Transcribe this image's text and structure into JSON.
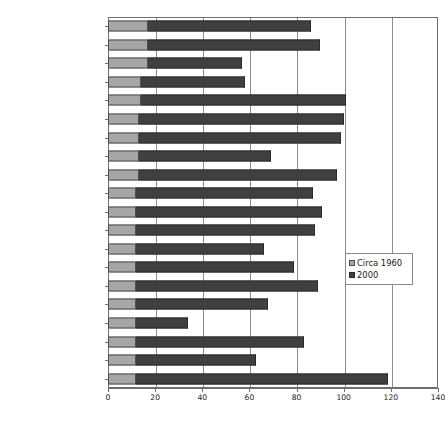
{
  "chart_data": {
    "type": "bar",
    "orientation": "horizontal",
    "stacked": true,
    "title": "",
    "xlabel": "",
    "ylabel": "",
    "xlim": [
      0,
      140
    ],
    "xticks": [
      0,
      20,
      40,
      60,
      80,
      100,
      120,
      140
    ],
    "grid": true,
    "legend_position": "center-right",
    "categories": [
      "Malaysia",
      "Lebanon",
      "Iraq",
      "Syrian Arab Republic",
      "Egypt",
      "South Africa",
      "Peru",
      "Turkey",
      "Cuba",
      "Tunisia",
      "Thailand",
      "Iran, Islamic Republic of",
      "Ecuador",
      "Colombia",
      "Bolivia",
      "Paraguay",
      "Pakistan",
      "Mexico",
      "El Salvador",
      "Brazil"
    ],
    "series": [
      {
        "name": "Circa 1960",
        "color": "#a6a6a6",
        "values": [
          17,
          17,
          17,
          14,
          14,
          13,
          13,
          13,
          13,
          12,
          12,
          12,
          12,
          12,
          12,
          12,
          12,
          12,
          12,
          12
        ]
      },
      {
        "name": "2000",
        "color": "#404040",
        "values": [
          69,
          73,
          40,
          44,
          87,
          87,
          86,
          56,
          84,
          75,
          79,
          76,
          54,
          67,
          77,
          56,
          22,
          71,
          51,
          107
        ]
      }
    ],
    "totals": [
      86,
      90,
      57,
      58,
      101,
      100,
      99,
      69,
      97,
      87,
      91,
      88,
      66,
      79,
      89,
      68,
      34,
      83,
      63,
      119
    ]
  },
  "legend": {
    "items": [
      {
        "label": "Circa 1960",
        "swatch": "sw-1960"
      },
      {
        "label": "2000",
        "swatch": "sw-2000"
      }
    ]
  }
}
